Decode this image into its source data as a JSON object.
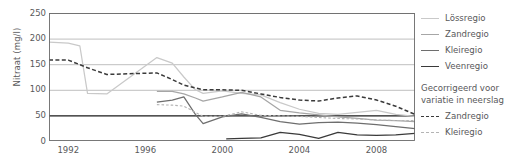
{
  "chart_data": {
    "type": "line",
    "title": "",
    "xlabel": "",
    "ylabel": "Nitraat (mg/l)",
    "xlim": [
      1991,
      2010
    ],
    "ylim": [
      0,
      250
    ],
    "yticks": [
      0,
      50,
      100,
      150,
      200,
      250
    ],
    "xticks": [
      1992,
      1996,
      2000,
      2004,
      2008
    ],
    "grid": "horizontal",
    "legend_position": "right",
    "threshold_line": 50,
    "series": [
      {
        "name": "Lössregio",
        "color": "#c9c9c9",
        "style": "solid",
        "x": [
          1991,
          1992,
          1992.6,
          1993,
          1994,
          1996.6,
          1997.4,
          1998,
          1998.6,
          1999,
          2000,
          2001,
          2002,
          2003,
          2004,
          2005,
          2006,
          2007,
          2008,
          2009,
          2010
        ],
        "y": [
          193,
          191,
          186,
          93,
          92,
          163,
          152,
          125,
          100,
          93,
          98,
          93,
          90,
          75,
          62,
          54,
          52,
          56,
          60,
          52,
          48
        ]
      },
      {
        "name": "Zandregio",
        "color": "#a6a6a6",
        "style": "solid",
        "x": [
          1996.6,
          1997.4,
          1998,
          1998.6,
          1999,
          2000,
          2001,
          2002,
          2003,
          2004,
          2005,
          2006,
          2007,
          2008,
          2009,
          2010
        ],
        "y": [
          97,
          97,
          92,
          84,
          78,
          86,
          95,
          86,
          60,
          55,
          51,
          47,
          44,
          41,
          40,
          38
        ]
      },
      {
        "name": "Kleiregio",
        "color": "#6e6e6e",
        "style": "solid",
        "x": [
          1996.6,
          1997.4,
          1998,
          1998.6,
          1999,
          2000,
          2001,
          2002,
          2003,
          2004,
          2005,
          2006,
          2007,
          2008,
          2009,
          2010
        ],
        "y": [
          76,
          80,
          86,
          52,
          34,
          47,
          53,
          46,
          38,
          33,
          36,
          37,
          35,
          32,
          28,
          24
        ]
      },
      {
        "name": "Veenregio",
        "color": "#3a3a3a",
        "style": "solid",
        "x": [
          2000.2,
          2001,
          2002,
          2003,
          2004,
          2005,
          2006,
          2007,
          2008,
          2009,
          2010
        ],
        "y": [
          4,
          5,
          6,
          17,
          13,
          5,
          17,
          12,
          11,
          12,
          15
        ]
      },
      {
        "name": "Zandregio gecorrigeerd",
        "color": "#3a3a3a",
        "style": "dashed",
        "x": [
          1991,
          1992,
          1993,
          1994,
          1996.6,
          1997.4,
          1998,
          1999,
          2000,
          2001,
          2002,
          2003,
          2004,
          2005,
          2006,
          2007,
          2008,
          2009,
          2010
        ],
        "y": [
          158,
          158,
          143,
          130,
          133,
          120,
          109,
          100,
          100,
          99,
          92,
          85,
          80,
          78,
          84,
          88,
          80,
          68,
          52
        ]
      },
      {
        "name": "Kleiregio gecorrigeerd",
        "color": "#b4b4b4",
        "style": "dotted",
        "x": [
          1996.6,
          1997.4,
          1998,
          1999,
          2000,
          2001,
          2002,
          2003,
          2004,
          2005,
          2006,
          2007,
          2008,
          2009,
          2010
        ],
        "y": [
          71,
          70,
          68,
          48,
          48,
          57,
          50,
          49,
          48,
          46,
          44,
          43,
          41,
          40,
          40
        ]
      }
    ]
  },
  "axis": {
    "ylabel": "Nitraat (mg/l)",
    "yticks": [
      "250",
      "200",
      "150",
      "100",
      "50",
      "0"
    ],
    "xticks": [
      "1992",
      "1996",
      "2000",
      "2004",
      "2008"
    ]
  },
  "legend": {
    "items": [
      {
        "label": "Lössregio",
        "color": "#c9c9c9",
        "style": "solid"
      },
      {
        "label": "Zandregio",
        "color": "#a6a6a6",
        "style": "solid"
      },
      {
        "label": "Kleiregio",
        "color": "#6e6e6e",
        "style": "solid"
      },
      {
        "label": "Veenregio",
        "color": "#3a3a3a",
        "style": "solid"
      }
    ],
    "note_line1": "Gecorrigeerd voor",
    "note_line2": "variatie in neerslag",
    "corrected": [
      {
        "label": "Zandregio",
        "color": "#3a3a3a",
        "style": "dash"
      },
      {
        "label": "Kleiregio",
        "color": "#b4b4b4",
        "style": "dot"
      }
    ]
  }
}
